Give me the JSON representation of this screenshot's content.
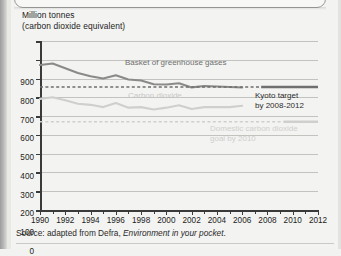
{
  "figure": {
    "axis_title_line1": "Million tonnes",
    "axis_title_line2": "(carbon dioxide equivalent)",
    "source_prefix": "Source: adapted from Defra, ",
    "source_italic": "Environment in your pocket",
    "source_suffix": "."
  },
  "chart_data": {
    "type": "line",
    "title": "",
    "xlabel": "",
    "ylabel": "Million tonnes (carbon dioxide equivalent)",
    "ylim": [
      0,
      900
    ],
    "xlim": [
      1990,
      2012
    ],
    "ytick_step": 100,
    "grid": true,
    "legend": "inline-annotations",
    "yticks": [
      0,
      100,
      200,
      300,
      400,
      500,
      600,
      700,
      800,
      900
    ],
    "xticks": [
      1990,
      1991,
      1992,
      1993,
      1994,
      1995,
      1996,
      1997,
      1998,
      1999,
      2000,
      2001,
      2002,
      2003,
      2004,
      2005,
      2006,
      2007,
      2008,
      2009,
      2010,
      2011,
      2012
    ],
    "xtick_labels": [
      1990,
      1992,
      1994,
      1996,
      1998,
      2000,
      2002,
      2004,
      2006,
      2008,
      2010,
      2012
    ],
    "series": [
      {
        "name": "Basket of greenhouse gases",
        "color": "#8a8a88",
        "style": "solid",
        "x": [
          1990,
          1991,
          1992,
          1993,
          1994,
          1995,
          1996,
          1997,
          1998,
          1999,
          2000,
          2001,
          2002,
          2003,
          2004,
          2005,
          2006
        ],
        "values": [
          772,
          780,
          755,
          730,
          712,
          700,
          718,
          695,
          690,
          670,
          668,
          675,
          653,
          660,
          658,
          655,
          652
        ]
      },
      {
        "name": "Carbon dioxide",
        "color": "#cfcfcd",
        "style": "solid",
        "x": [
          1990,
          1991,
          1992,
          1993,
          1994,
          1995,
          1996,
          1997,
          1998,
          1999,
          2000,
          2001,
          2002,
          2003,
          2004,
          2005,
          2006
        ],
        "values": [
          592,
          600,
          585,
          566,
          560,
          548,
          570,
          545,
          548,
          535,
          545,
          558,
          538,
          548,
          548,
          548,
          555
        ]
      },
      {
        "name": "Kyoto target by 2008-2012",
        "color": "#6f6f6f",
        "style": "dashed-with-solid-end",
        "value": 655,
        "x_start": 1990,
        "x_end": 2012,
        "solid_from": 2007.5
      },
      {
        "name": "Domestic carbon dioxide goal by 2010",
        "color": "#cfcfcd",
        "style": "dashed-with-solid-end",
        "value": 470,
        "x_start": 1990,
        "x_end": 2012,
        "solid_from": 2009.3
      }
    ],
    "annotations": [
      {
        "text": "Basket of greenhouse gases",
        "series": "Basket of greenhouse gases"
      },
      {
        "text": "Carbon dioxide",
        "series": "Carbon dioxide"
      },
      {
        "text_line1": "Kyoto target",
        "text_line2": "by 2008-2012",
        "series": "Kyoto target by 2008-2012"
      },
      {
        "text_line1": "Domestic carbon dioxide",
        "text_line2": "goal by 2010",
        "series": "Domestic carbon dioxide goal by 2010"
      }
    ]
  }
}
